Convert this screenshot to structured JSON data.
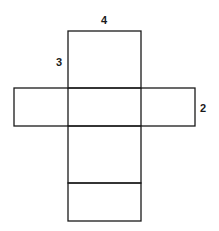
{
  "diagram": {
    "type": "net of rectangular prism",
    "labels": {
      "top_width": "4",
      "left_height": "3",
      "right_depth": "2"
    },
    "line_color": "#1a1a1a",
    "dimensions": {
      "length": 4,
      "width": 3,
      "height": 2
    }
  }
}
